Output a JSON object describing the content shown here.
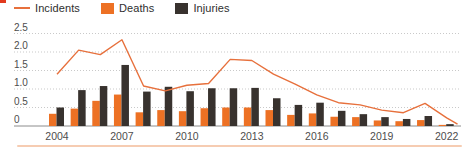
{
  "decorations": {
    "corner_mark_color": "#e23a1e",
    "bottom_rule_color": "#f6ccb2"
  },
  "legend": {
    "items": [
      {
        "label": "Incidents",
        "swatch": "line",
        "color": "#e7703c"
      },
      {
        "label": "Deaths",
        "swatch": "square",
        "color": "#ed7124"
      },
      {
        "label": "Injuries",
        "swatch": "square",
        "color": "#38322e"
      }
    ]
  },
  "chart_data": {
    "type": "combo-line-grouped-bar",
    "years": [
      2004,
      2005,
      2006,
      2007,
      2008,
      2009,
      2010,
      2011,
      2012,
      2013,
      2014,
      2015,
      2016,
      2017,
      2018,
      2019,
      2020,
      2021,
      2022
    ],
    "series": [
      {
        "name": "Incidents",
        "type": "line",
        "color": "#e7703c",
        "values": [
          1.4,
          2.05,
          1.93,
          2.33,
          1.08,
          0.95,
          1.1,
          1.15,
          1.8,
          1.77,
          1.4,
          1.13,
          0.84,
          0.63,
          0.57,
          0.43,
          0.36,
          0.61,
          0.22
        ]
      },
      {
        "name": "Deaths",
        "type": "bar",
        "color": "#ed7124",
        "values": [
          0.33,
          0.47,
          0.68,
          0.85,
          0.37,
          0.43,
          0.4,
          0.48,
          0.5,
          0.5,
          0.43,
          0.3,
          0.34,
          0.25,
          0.24,
          0.15,
          0.13,
          0.16,
          0.03
        ]
      },
      {
        "name": "Injuries",
        "type": "bar",
        "color": "#38322e",
        "values": [
          0.5,
          0.97,
          1.08,
          1.65,
          0.93,
          1.06,
          0.94,
          1.02,
          1.02,
          1.03,
          0.75,
          0.57,
          0.63,
          0.41,
          0.32,
          0.24,
          0.19,
          0.27,
          0.05
        ]
      }
    ],
    "incidents_edge_point": {
      "years_from_start": 18.5,
      "value": 0.05
    },
    "x_tick_labels": [
      "2004",
      "2007",
      "2010",
      "2013",
      "2016",
      "2019",
      "2022"
    ],
    "y_ticks": [
      0,
      0.5,
      1.0,
      1.5,
      2.0,
      2.5
    ],
    "ylim": [
      0,
      2.5
    ],
    "grid": "dotted-horizontal",
    "legend_position": "top-left",
    "axis_text_color": "#4d4d4d",
    "gridline_color": "#c9c9c9",
    "baseline_color": "#8c8c8c"
  }
}
